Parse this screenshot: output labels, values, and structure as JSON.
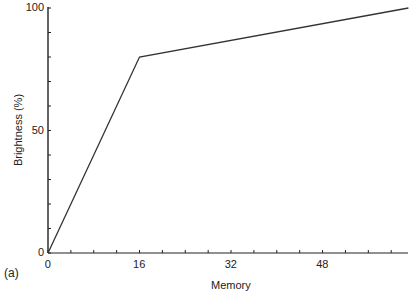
{
  "chart_data": {
    "type": "line",
    "title": "",
    "panel_label": "(a)",
    "xlabel": "Memory",
    "ylabel": "Brightness (%)",
    "xlim": [
      0,
      63
    ],
    "ylim": [
      0,
      100
    ],
    "x_ticks_major": [
      0,
      16,
      32,
      48
    ],
    "x_tick_labels": [
      "0",
      "16",
      "32",
      "48"
    ],
    "x_minor_tick_step": 4,
    "y_ticks_major": [
      0,
      50,
      100
    ],
    "y_tick_labels": [
      "0",
      "50",
      "100"
    ],
    "y_minor_tick_step": 10,
    "grid": false,
    "legend": null,
    "series": [
      {
        "name": "Brightness",
        "x": [
          0,
          16,
          63
        ],
        "y": [
          0,
          80,
          100
        ]
      }
    ]
  },
  "line_color": "#333333",
  "axis_color": "#222222"
}
